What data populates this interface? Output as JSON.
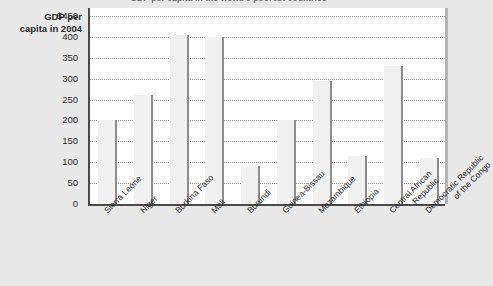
{
  "chart_data": {
    "type": "bar",
    "title": "GDP per capita in the world's poorest countries",
    "ylabel": "GDP per capita in 2004",
    "xlabel": "",
    "categories": [
      "Sierra Leone",
      "Niger",
      "Burkina Faso",
      "Mali",
      "Burundi",
      "Guinea-Bissau",
      "Mozambique",
      "Ethiopia",
      "Central African\nRepublic",
      "Democratic Republic\nof the Congo"
    ],
    "values": [
      200,
      260,
      405,
      400,
      90,
      200,
      295,
      115,
      330,
      110
    ],
    "ylim": [
      0,
      450
    ],
    "ytick_labels": [
      "$450",
      "400",
      "350",
      "300",
      "250",
      "200",
      "150",
      "100",
      "50",
      "0"
    ],
    "ytick_values": [
      450,
      400,
      350,
      300,
      250,
      200,
      150,
      100,
      50,
      0
    ],
    "grid": true,
    "legend": false,
    "colors": {
      "bar_fill": "#f1f1f1",
      "bar_edge": "#8c8c8c",
      "plot_bg": "#ffffff",
      "page_bg": "#e8e8e8",
      "axis": "#4a4a4a",
      "gridline": "#9a9a9a",
      "text": "#2b2b2b"
    }
  },
  "axis_title": {
    "line1": "GDP per",
    "line2": "capita in 2004"
  }
}
